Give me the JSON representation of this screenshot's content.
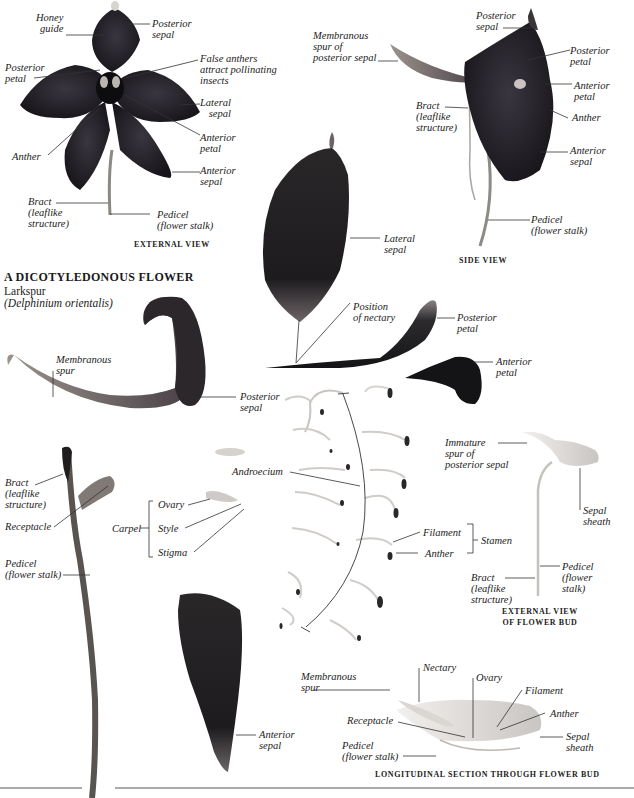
{
  "plate": {
    "title": "A DICOTYLEDONOUS FLOWER",
    "common_name": "Larkspur",
    "scientific_name": "(Delphinium orientalis)"
  },
  "external_view": {
    "caption": "EXTERNAL VIEW",
    "labels": {
      "honey_guide": "Honey\nguide",
      "posterior_sepal": "Posterior\nsepal",
      "posterior_petal": "Posterior\npetal",
      "false_anthers": "False anthers\nattract pollinating\ninsects",
      "lateral_sepal": "Lateral\nsepal",
      "anterior_petal": "Anterior\npetal",
      "anther": "Anther",
      "anterior_sepal": "Anterior\nsepal",
      "bract": "Bract\n(leaflike\nstructure)",
      "pedicel": "Pedicel\n(flower stalk)"
    }
  },
  "side_view": {
    "caption": "SIDE VIEW",
    "labels": {
      "membranous_spur": "Membranous\nspur of\nposterior sepal",
      "posterior_sepal": "Posterior\nsepal",
      "posterior_petal": "Posterior\npetal",
      "anterior_petal": "Anterior\npetal",
      "bract": "Bract\n(leaflike\nstructure)",
      "anther": "Anther",
      "anterior_sepal": "Anterior\nsepal",
      "pedicel": "Pedicel\n(flower stalk)"
    }
  },
  "dissected_parts": {
    "lateral_sepal": "Lateral\nsepal",
    "position_of_nectary": "Position\nof nectary",
    "posterior_petal": "Posterior\npetal",
    "anterior_petal": "Anterior\npetal",
    "membranous_spur": "Membranous\nspur",
    "posterior_sepal": "Posterior\nsepal",
    "bract": "Bract\n(leaflike\nstructure)",
    "receptacle": "Receptacle",
    "pedicel": "Pedicel\n(flower stalk)",
    "anterior_sepal": "Anterior\nsepal"
  },
  "carpel": {
    "label": "Carpel",
    "parts": [
      "Ovary",
      "Style",
      "Stigma"
    ]
  },
  "androecium": {
    "label": "Androecium",
    "filament": "Filament",
    "anther": "Anther",
    "stamen": "Stamen"
  },
  "flower_bud": {
    "caption": "EXTERNAL VIEW\nOF FLOWER BUD",
    "labels": {
      "immature_spur": "Immature\nspur of\nposterior sepal",
      "sepal_sheath": "Sepal\nsheath",
      "pedicel": "Pedicel\n(flower\nstalk)",
      "bract": "Bract\n(leaflike\nstructure)"
    }
  },
  "longitudinal_section": {
    "caption": "LONGITUDINAL SECTION THROUGH FLOWER BUD",
    "labels": {
      "membranous_spur": "Membranous\nspur",
      "nectary": "Nectary",
      "ovary": "Ovary",
      "filament": "Filament",
      "receptacle": "Receptacle",
      "anther": "Anther",
      "pedicel": "Pedicel\n(flower stalk)",
      "sepal_sheath": "Sepal\nsheath"
    }
  },
  "colors": {
    "petal_dark": "#1e1c22",
    "petal_mid": "#3c3840",
    "stalk": "#8a8580",
    "line": "#333333",
    "background": "#ffffff"
  }
}
